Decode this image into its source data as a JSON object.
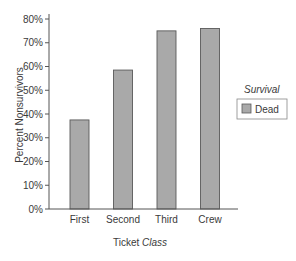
{
  "chart_data": {
    "type": "bar",
    "title": "",
    "categories": [
      "First",
      "Second",
      "Third",
      "Crew"
    ],
    "series": [
      {
        "name": "Dead",
        "values": [
          37.5,
          58.5,
          75,
          76
        ],
        "color": "#a9a9a9"
      }
    ],
    "values": [
      37.5,
      58.5,
      75,
      76
    ],
    "xlabel": "Ticket Class",
    "xlabel_parts": {
      "upright": "Ticket ",
      "italic": "Class"
    },
    "ylabel": "Percent Nonsurvivors",
    "ylim": [
      0,
      80
    ],
    "yticks": [
      "0%",
      "10%",
      "20%",
      "30%",
      "40%",
      "50%",
      "60%",
      "70%",
      "80%"
    ],
    "grid": false,
    "legend": {
      "title": "Survival",
      "position": "right",
      "entries": [
        "Dead"
      ]
    }
  },
  "colors": {
    "bar_fill": "#a9a9a9",
    "bar_stroke": "#5a5a5a",
    "axis": "#555555"
  }
}
